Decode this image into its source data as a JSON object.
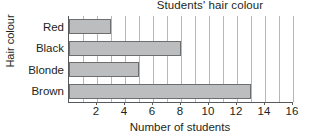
{
  "chart_data": {
    "type": "bar",
    "orientation": "horizontal",
    "title": "Students' hair colour",
    "xlabel": "Number of students",
    "ylabel": "Hair colour",
    "categories": [
      "Red",
      "Black",
      "Blonde",
      "Brown"
    ],
    "values": [
      3,
      8,
      5,
      13
    ],
    "xlim": [
      0,
      16
    ],
    "xticks": [
      2,
      4,
      6,
      8,
      10,
      12,
      14,
      16
    ],
    "xtick_labels": [
      "2",
      "4",
      "6",
      "8",
      "10",
      "12",
      "14",
      "16"
    ],
    "gridlines_every": 1,
    "grid": true,
    "legend": false,
    "bar_fill_color": "#bcbdbf",
    "bar_edge_color": "#6d6e70",
    "grid_color": "#b6b7b9",
    "axis_color": "#58595b",
    "text_color": "#231f20",
    "background_color": "#ffffff"
  }
}
